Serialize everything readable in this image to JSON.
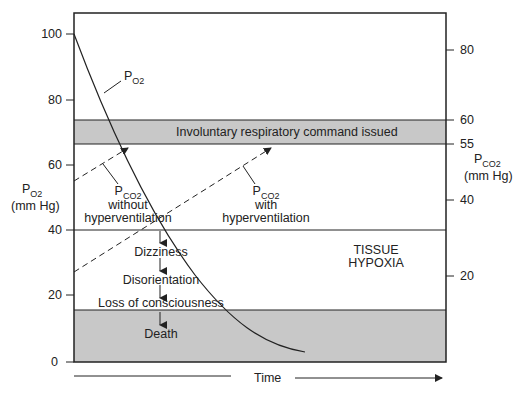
{
  "left_axis": {
    "label_main": "P",
    "label_sub": "O2",
    "unit": "(mm Hg)",
    "ticks": [
      "100",
      "80",
      "60",
      "40",
      "20",
      "0"
    ]
  },
  "right_axis": {
    "label_main": "P",
    "label_sub": "CO2",
    "unit": "(mm Hg)",
    "ticks": [
      "80",
      "60",
      "55",
      "40",
      "20"
    ]
  },
  "bands": {
    "command": "Involuntary respiratory command issued",
    "hypoxia_line1": "TISSUE",
    "hypoxia_line2": "HYPOXIA"
  },
  "curves": {
    "po2_main": "P",
    "po2_sub": "O2",
    "pco2_without_main": "P",
    "pco2_without_sub": "CO2",
    "pco2_without_line1": "without",
    "pco2_without_line2": "hyperventilation",
    "pco2_with_main": "P",
    "pco2_with_sub": "CO2",
    "pco2_with_line1": "with",
    "pco2_with_line2": "hyperventilation"
  },
  "stages": [
    "Dizziness",
    "Disorientation",
    "Loss of consciousness",
    "Death"
  ],
  "x_axis": {
    "label": "Time"
  },
  "colors": {
    "band_gray": "#c8c8c8",
    "line": "#222222"
  }
}
